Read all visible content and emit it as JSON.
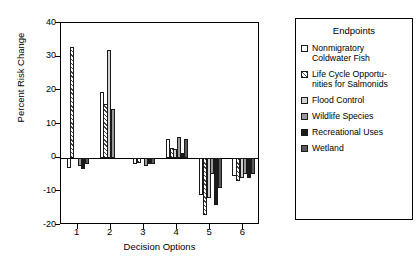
{
  "chart_data": {
    "type": "bar",
    "title": "",
    "xlabel": "Decision Options",
    "ylabel": "Percent Risk Change",
    "categories": [
      "1",
      "2",
      "3",
      "4",
      "5",
      "6"
    ],
    "ylim": [
      -20,
      40
    ],
    "yticks": [
      -20,
      -10,
      0,
      10,
      20,
      30,
      40
    ],
    "ytick_labels": [
      "-20",
      "-10",
      "0",
      "10",
      "20",
      "30",
      "40"
    ],
    "grid": false,
    "legend_position": "right",
    "legend_title": "Endpoints",
    "series": [
      {
        "name": "Nonmigratory Coldwater Fish",
        "fill": "open",
        "values": [
          -3,
          19.5,
          -2,
          5.5,
          -11,
          -5.5
        ]
      },
      {
        "name": "Life Cycle Opportunities for Salmonids",
        "fill": "hatch",
        "values": [
          33,
          16,
          -1.5,
          3,
          -17,
          -7
        ]
      },
      {
        "name": "Flood Control",
        "fill": "lgray",
        "values": [
          0,
          32,
          0,
          2.5,
          -12,
          -6
        ]
      },
      {
        "name": "Wildlife Species",
        "fill": "mgray",
        "values": [
          -2.5,
          14.5,
          -2.5,
          6,
          -5,
          -5
        ]
      },
      {
        "name": "Recreational Uses",
        "fill": "black",
        "values": [
          -3.5,
          0,
          -2,
          1.5,
          -14,
          -6
        ]
      },
      {
        "name": "Wetland",
        "fill": "dgray",
        "values": [
          -2,
          0,
          -2,
          5.5,
          -9,
          -5
        ]
      }
    ]
  },
  "legend": {
    "title": "Endpoints",
    "entries": [
      {
        "label": "Nonmigratory\nColdwater Fish",
        "fill": "open"
      },
      {
        "label": "Life Cycle Opportu-\nnities for Salmonids",
        "fill": "hatch"
      },
      {
        "label": "Flood Control",
        "fill": "lgray"
      },
      {
        "label": "Wildlife Species",
        "fill": "mgray"
      },
      {
        "label": "Recreational Uses",
        "fill": "black"
      },
      {
        "label": "Wetland",
        "fill": "dgray"
      }
    ]
  },
  "axes": {
    "y_title": "Percent Risk Change",
    "x_title": "Decision Options"
  }
}
